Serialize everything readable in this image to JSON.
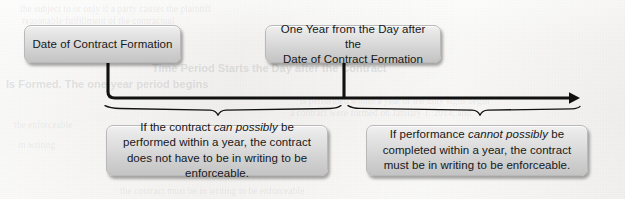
{
  "diagram": {
    "type": "timeline",
    "background_color": "#f2f1ef",
    "line_color": "#111111",
    "box_border_color": "#b9b9b9",
    "box_fill_top": "#f0f0f0",
    "box_fill_bottom": "#c4c4c4",
    "text_color": "#16181a"
  },
  "nodes": {
    "start": {
      "label": "Date of Contract Formation",
      "position": "top-left",
      "x": 24,
      "y": 25,
      "width": 157,
      "height": 38
    },
    "one_year": {
      "line1": "One Year from the Day after the",
      "line2": "Date of Contract Formation",
      "position": "top-center",
      "x": 265,
      "y": 25,
      "width": 176,
      "height": 38
    },
    "left_outcome": {
      "segments": [
        {
          "text": "If the contract ",
          "italic": false
        },
        {
          "text": "can possibly",
          "italic": true
        },
        {
          "text": " be performed within a year, the contract does not have to be in writing to be enforceable.",
          "italic": false
        }
      ],
      "plain": "If the contract can possibly be performed within a year, the contract does not have to be in writing to be enforceable.",
      "position": "bottom-left",
      "x": 106,
      "y": 125,
      "width": 222,
      "height": 51
    },
    "right_outcome": {
      "segments": [
        {
          "text": "If performance ",
          "italic": false
        },
        {
          "text": "cannot possibly",
          "italic": true
        },
        {
          "text": " be completed within a year, the contract must be in writing to be enforceable.",
          "italic": false
        }
      ],
      "plain": "If performance cannot possibly be completed within a year, the contract must be in writing to be enforceable.",
      "position": "bottom-right",
      "x": 366,
      "y": 125,
      "width": 222,
      "height": 51
    }
  },
  "connectors": {
    "start_drop": {
      "from_x": 108,
      "from_y": 63,
      "corner_y": 98,
      "to_x": 578,
      "arrow": true
    },
    "one_year_tick": {
      "x": 344,
      "from_y": 63,
      "to_y": 98
    },
    "left_brace": {
      "start_x": 105,
      "end_x": 340,
      "point_x": 218,
      "y": 107
    },
    "right_brace": {
      "start_x": 348,
      "end_x": 530,
      "point_x": 480,
      "y": 107
    }
  },
  "ghost_text": {
    "top_line_1": "the subject to or only if a party causes the plaintiff",
    "top_line_2": "reasonable fulfillment of the contractual",
    "top_line_3": "considerations to the parties",
    "heading": "Time Period Starts the Day after the Contract",
    "heading_2": "Is Formed. The one-year period begins",
    "body_right_1": "is performed within a year of the duty signs begin",
    "body_right_2": "a contract were formed on January 1, 2014, and",
    "body_left_1": "the enforceable",
    "body_left_2": "in writing",
    "bottom_line": "the contract must be in writing to be enforceable"
  }
}
